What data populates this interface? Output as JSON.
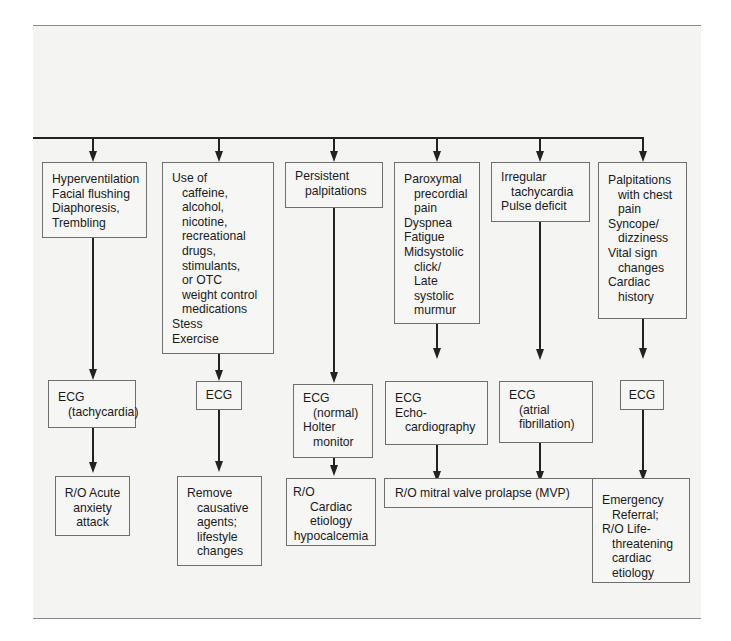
{
  "diagram": {
    "type": "flowchart",
    "columns": [
      {
        "presentation": [
          "Hyperventilation",
          "Facial flushing",
          "Diaphoresis,",
          "Trembling"
        ],
        "test": [
          "ECG",
          "(tachycardia)"
        ],
        "outcome": [
          "R/O Acute",
          "anxiety",
          "attack"
        ]
      },
      {
        "presentation": [
          "Use of",
          "caffeine,",
          "alcohol,",
          "nicotine,",
          "recreational",
          "drugs,",
          "stimulants,",
          "or OTC",
          "weight control",
          "medications",
          "Stess",
          "Exercise"
        ],
        "test": [
          "ECG"
        ],
        "outcome": [
          "Remove",
          "causative",
          "agents;",
          "lifestyle",
          "changes"
        ]
      },
      {
        "presentation": [
          "Persistent",
          "palpitations"
        ],
        "test": [
          "ECG",
          "(normal)",
          "Holter",
          "monitor"
        ],
        "outcome": [
          "R/O",
          "Cardiac",
          "etiology",
          "hypocalcemia"
        ]
      },
      {
        "presentation": [
          "Paroxymal",
          "precordial",
          "pain",
          "Dyspnea",
          "Fatigue",
          "Midsystolic",
          "click/",
          "Late",
          "systolic",
          "murmur"
        ],
        "test": [
          "ECG",
          "Echo-",
          "cardiography"
        ]
      },
      {
        "presentation": [
          "Irregular",
          "tachycardia",
          "Pulse deficit"
        ],
        "test": [
          "ECG",
          "(atrial",
          "fibrillation)"
        ]
      },
      {
        "presentation": [
          "Palpitations",
          "with chest",
          "pain",
          "Syncope/",
          "dizziness",
          "Vital sign",
          "changes",
          "Cardiac",
          "history"
        ],
        "test": [
          "ECG"
        ],
        "outcome": [
          "Emergency",
          "Referral;",
          "R/O Life-",
          "threatening",
          "cardiac",
          "etiology"
        ]
      }
    ],
    "shared_outcome": {
      "from_columns": [
        4,
        5
      ],
      "text": "R/O mitral valve prolapse (MVP)"
    }
  },
  "colors": {
    "background_band": "#f4f4f3",
    "box_border": "#6e6e6e",
    "line": "#222222",
    "text": "#1a1a1a"
  }
}
